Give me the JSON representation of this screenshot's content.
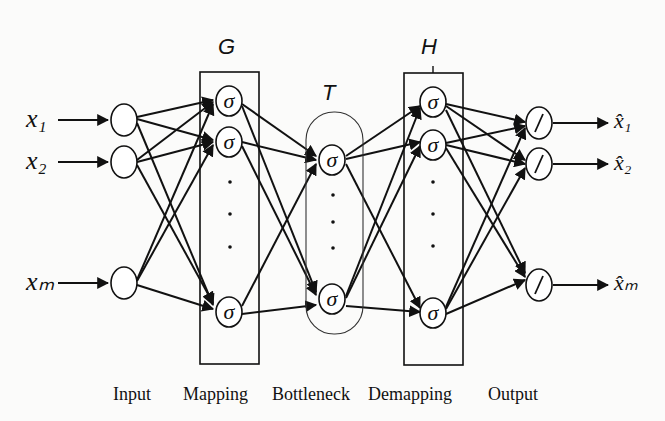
{
  "diagram": {
    "type": "autoassociative neural network",
    "group_labels": {
      "mapping_box": "G",
      "bottleneck_box": "T",
      "demapping_box": "H"
    },
    "input_labels": [
      "x₁",
      "x₂",
      "xₘ"
    ],
    "output_labels": [
      "x̂₁",
      "x̂₂",
      "x̂ₘ"
    ],
    "hidden_node_symbol": "σ",
    "output_node_symbol": "/",
    "ellipsis": "⋮",
    "layer_labels": [
      "Input",
      "Mapping",
      "Bottleneck",
      "Demapping",
      "Output"
    ]
  }
}
